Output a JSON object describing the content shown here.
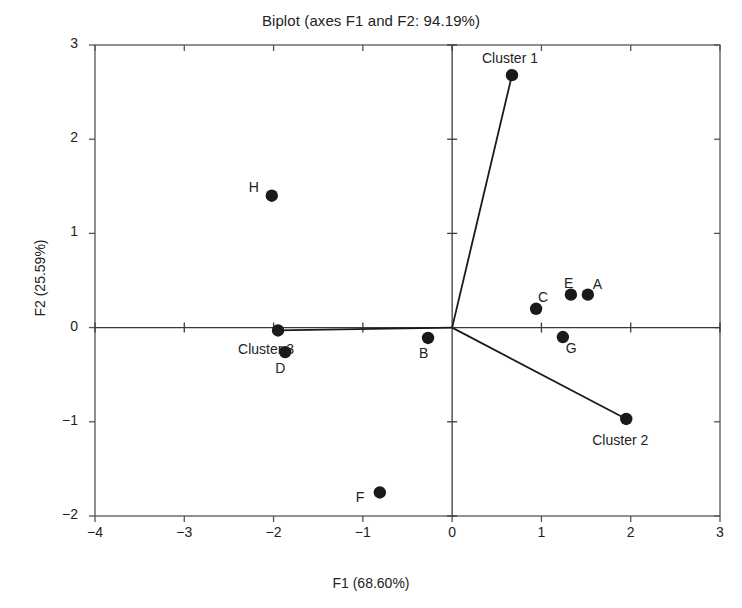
{
  "chart_data": {
    "type": "scatter",
    "title": "Biplot (axes F1 and F2: 94.19%)",
    "xlabel": "F1 (68.60%)",
    "ylabel": "F2 (25.59%)",
    "xlim": [
      -4,
      3
    ],
    "ylim": [
      -2,
      3
    ],
    "xticks": [
      -4,
      -3,
      -2,
      -1,
      0,
      1,
      2,
      3
    ],
    "yticks": [
      -2,
      -1,
      0,
      1,
      2,
      3
    ],
    "xtick_labels": [
      "−4",
      "−3",
      "−2",
      "−1",
      "0",
      "1",
      "2",
      "3"
    ],
    "ytick_labels": [
      "−2",
      "−1",
      "0",
      "1",
      "2",
      "3"
    ],
    "grid": false,
    "legend": "none",
    "marker_color": "#1a1a1a",
    "line_color": "#1a1a1a",
    "frame_color": "#555555",
    "observations": [
      {
        "label": "A",
        "x": 1.52,
        "y": 0.35,
        "label_dx": 10,
        "label_dy": -10
      },
      {
        "label": "B",
        "x": -0.27,
        "y": -0.11,
        "label_dx": -4,
        "label_dy": 16
      },
      {
        "label": "C",
        "x": 0.94,
        "y": 0.2,
        "label_dx": 7,
        "label_dy": -11
      },
      {
        "label": "D",
        "x": -1.87,
        "y": -0.26,
        "label_dx": -5,
        "label_dy": 17
      },
      {
        "label": "E",
        "x": 1.33,
        "y": 0.35,
        "label_dx": -2,
        "label_dy": -11
      },
      {
        "label": "F",
        "x": -0.81,
        "y": -1.75,
        "label_dx": -19,
        "label_dy": 6
      },
      {
        "label": "G",
        "x": 1.24,
        "y": -0.1,
        "label_dx": 8,
        "label_dy": 12
      },
      {
        "label": "H",
        "x": -2.02,
        "y": 1.4,
        "label_dx": -18,
        "label_dy": -8
      }
    ],
    "cluster_vectors": [
      {
        "label": "Cluster 1",
        "x": 0.67,
        "y": 2.68,
        "label_dx": 2,
        "label_dy": -16
      },
      {
        "label": "Cluster 2",
        "x": 1.95,
        "y": -0.97,
        "label_dx": -2,
        "label_dy": 22
      },
      {
        "label": "Cluster 3",
        "x": -1.95,
        "y": -0.03,
        "label_dx": -8,
        "label_dy": 20
      }
    ],
    "origin": {
      "x": 0,
      "y": 0
    }
  }
}
